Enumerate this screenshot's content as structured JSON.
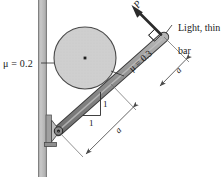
{
  "figure": {
    "type": "engineering-mechanics-free-body-diagram",
    "labels": {
      "mu_wall": "μ = 0.2",
      "mu_bar": "μ = 0.3",
      "force_p": "P",
      "bar_note_line1": "Light, thin",
      "bar_note_line2": "bar",
      "dimension_upper": "a",
      "dimension_lower": "a",
      "slope_rise": "1",
      "slope_run": "1"
    },
    "values": {
      "mu_wall_value": 0.2,
      "mu_bar_value": 0.3,
      "slope_rise_value": 1,
      "slope_run_value": 1,
      "bar_angle_deg": 45,
      "segment_length_symbol": "a",
      "segment_count": 2
    },
    "colors": {
      "wall_fill": "#b8b8b8",
      "wall_edge": "#8c8c8c",
      "disk_fill": "#cfcfcf",
      "disk_edge": "#4a4a4a",
      "bar_fill": "#9a9a9a",
      "bar_edge": "#3a3a3a",
      "support_fill": "#b0b0b0",
      "line_color": "#2b2b2b",
      "dimension_color": "#6e6e6e",
      "text_color": "#1a1a1a",
      "background": "#ffffff"
    },
    "geometry": {
      "wall_x_left": 38,
      "wall_x_right": 47,
      "disk_center_x": 85,
      "disk_center_y": 58,
      "disk_radius": 31,
      "bar_pivot_x": 58,
      "bar_pivot_y": 131,
      "bar_tip_x": 164,
      "bar_tip_y": 37
    },
    "icon_names": {
      "center_mark": "disk-center-dot-icon",
      "pin_support": "pin-support-icon",
      "right_angle": "right-angle-marker-icon",
      "arrow": "force-arrow-icon"
    }
  }
}
